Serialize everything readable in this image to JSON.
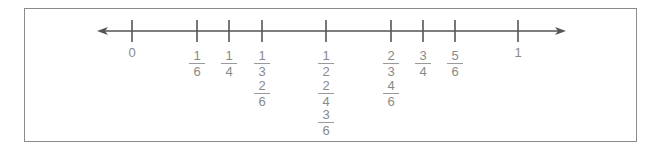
{
  "diagram": {
    "type": "number-line",
    "range": [
      0,
      1
    ],
    "colors": {
      "line": "#555555",
      "label": "#8a8a8a",
      "border": "#8a8a8a"
    },
    "endpoints": [
      {
        "value": 0,
        "label": "0",
        "x": 132
      },
      {
        "value": 1,
        "label": "1",
        "x": 518
      }
    ],
    "ticks": [
      {
        "value": 0,
        "x": 132
      },
      {
        "value": 0.1667,
        "x": 197
      },
      {
        "value": 0.25,
        "x": 229
      },
      {
        "value": 0.3333,
        "x": 262
      },
      {
        "value": 0.5,
        "x": 326
      },
      {
        "value": 0.6667,
        "x": 391
      },
      {
        "value": 0.75,
        "x": 423
      },
      {
        "value": 0.8333,
        "x": 455
      },
      {
        "value": 1,
        "x": 518
      }
    ],
    "fractions": [
      {
        "x": 197,
        "row": 0,
        "num": "1",
        "den": "6"
      },
      {
        "x": 229,
        "row": 0,
        "num": "1",
        "den": "4"
      },
      {
        "x": 262,
        "row": 0,
        "num": "1",
        "den": "3"
      },
      {
        "x": 262,
        "row": 1,
        "num": "2",
        "den": "6"
      },
      {
        "x": 326,
        "row": 0,
        "num": "1",
        "den": "2"
      },
      {
        "x": 326,
        "row": 1,
        "num": "2",
        "den": "4"
      },
      {
        "x": 326,
        "row": 2,
        "num": "3",
        "den": "6"
      },
      {
        "x": 391,
        "row": 0,
        "num": "2",
        "den": "3"
      },
      {
        "x": 391,
        "row": 1,
        "num": "4",
        "den": "6"
      },
      {
        "x": 423,
        "row": 0,
        "num": "3",
        "den": "4"
      },
      {
        "x": 455,
        "row": 0,
        "num": "5",
        "den": "6"
      }
    ]
  }
}
